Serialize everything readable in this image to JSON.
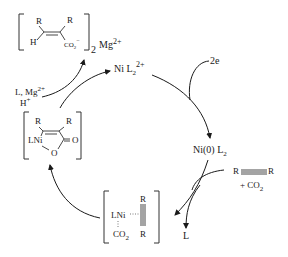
{
  "diagram": {
    "type": "catalytic-cycle",
    "species": {
      "product": {
        "substituent_top_left": "R",
        "substituent_top_right": "R",
        "substituent_bottom_left": "H",
        "group": "CO",
        "group_sub": "2",
        "group_charge": "−",
        "multiplier": "2",
        "counterion": "Mg",
        "counterion_charge": "2+"
      },
      "ni_dication": {
        "label": "Ni L",
        "sub": "2",
        "sup": "2+"
      },
      "ni_zero": {
        "label": "Ni(0) L",
        "sub": "2"
      },
      "alkyne_complex": {
        "metal": "LNi",
        "top": "R",
        "bottom": "R",
        "ligand": "CO",
        "ligand_sub": "2"
      },
      "nickelalactone": {
        "metal": "LNi",
        "r_left": "R",
        "r_right": "R",
        "carbonyl_o": "O",
        "ring_o": "O"
      }
    },
    "reagents": {
      "electrons": "2e",
      "alkyne_left": "R",
      "alkyne_right": "R",
      "co2": "+ CO",
      "co2_sub": "2",
      "ligand_released": "L",
      "quench_line1": "L, Mg",
      "quench_line1_sup": "2+",
      "quench_line2": "H",
      "quench_line2_sup": "+"
    }
  }
}
